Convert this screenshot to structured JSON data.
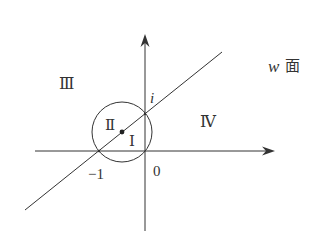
{
  "diagram": {
    "plane_label_var": "w",
    "plane_label_text": "面",
    "axis_labels": {
      "origin": "0",
      "minus_one": "−1",
      "imag_unit": "i"
    },
    "regions": {
      "I": "Ⅰ",
      "II": "Ⅱ",
      "III": "Ⅲ",
      "IV": "Ⅳ"
    },
    "colors": {
      "stroke": "#333333",
      "background": "#ffffff"
    }
  }
}
